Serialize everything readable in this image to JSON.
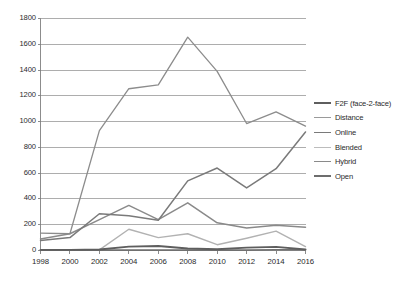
{
  "chart_data": {
    "type": "line",
    "title": "",
    "subtitle": "",
    "xlabel": "",
    "ylabel": "",
    "x": [
      1998,
      2000,
      2002,
      2004,
      2006,
      2008,
      2010,
      2012,
      2014,
      2016
    ],
    "categories": [
      "1998",
      "2000",
      "2002",
      "2004",
      "2006",
      "2008",
      "2010",
      "2012",
      "2014",
      "2016"
    ],
    "xlim": [
      1998,
      2016
    ],
    "ylim": [
      0,
      1800
    ],
    "ytick_values": [
      0,
      200,
      400,
      600,
      800,
      1000,
      1200,
      1400,
      1600,
      1800
    ],
    "ytick_labels": [
      "0",
      "200",
      "400",
      "600",
      "800",
      "1000",
      "1200",
      "1400",
      "1600",
      "1800"
    ],
    "grid": "horizontal",
    "legend_position": "right",
    "series": [
      {
        "name": "F2F (face-2-face)",
        "color": "#5e5e5e",
        "width": 1.9,
        "values": [
          5,
          5,
          8,
          30,
          35,
          15,
          10,
          22,
          28,
          8
        ]
      },
      {
        "name": "Distance",
        "color": "#8c8c8c",
        "width": 1.3,
        "values": [
          135,
          130,
          930,
          1255,
          1285,
          1655,
          1390,
          985,
          1075,
          965
        ]
      },
      {
        "name": "Online",
        "color": "#7a7a7a",
        "width": 1.5,
        "values": [
          78,
          100,
          285,
          270,
          235,
          540,
          640,
          485,
          635,
          920
        ]
      },
      {
        "name": "Blended",
        "color": "#b2b2b2",
        "width": 1.4,
        "values": [
          3,
          3,
          5,
          165,
          100,
          130,
          45,
          95,
          150,
          30
        ]
      },
      {
        "name": "Hybrid",
        "color": "#8a8a8a",
        "width": 1.5,
        "values": [
          90,
          130,
          240,
          350,
          240,
          370,
          215,
          175,
          195,
          180
        ]
      },
      {
        "name": "Open",
        "color": "#707070",
        "width": 1.6,
        "values": [
          2,
          2,
          3,
          3,
          3,
          3,
          3,
          3,
          5,
          5
        ]
      }
    ]
  },
  "legend": {
    "items": [
      {
        "label": "F2F (face-2-face)",
        "color": "#5e5e5e",
        "width": 2.3
      },
      {
        "label": "Distance",
        "color": "#9a9a9a",
        "width": 1.7
      },
      {
        "label": "Online",
        "color": "#7a7a7a",
        "width": 1.9
      },
      {
        "label": "Blended",
        "color": "#bcbcbc",
        "width": 1.7
      },
      {
        "label": "Hybrid",
        "color": "#8a8a8a",
        "width": 1.9
      },
      {
        "label": "Open",
        "color": "#6d6d6d",
        "width": 2.1
      }
    ]
  },
  "axes": {
    "axis_color": "#808080",
    "grid_color": "#999999",
    "tick_text_color": "#2b2b2b"
  }
}
